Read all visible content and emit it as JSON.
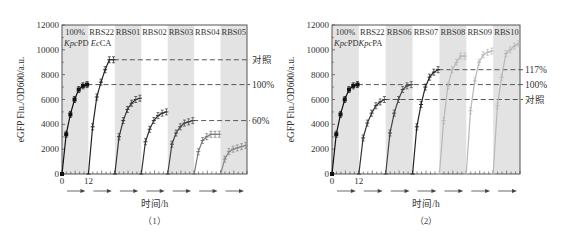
{
  "figure": {
    "panels": [
      {
        "id": "panel-1",
        "label": "（1）",
        "construct_label": {
          "italic1": "Kpc",
          "plain1": "PD ",
          "italic2": "Ec",
          "plain2": "CA"
        },
        "y_axis_label": "eGFP Flu./OD600/a.u.",
        "x_axis_label": "时间/h",
        "x_ticks": [
          "0",
          "12"
        ],
        "y_ticks": [
          "0",
          "2000",
          "4000",
          "6000",
          "8000",
          "10000",
          "12000"
        ],
        "segments": [
          "100%",
          "RBS22",
          "RBS01",
          "RBS02",
          "RBS03",
          "RBS04",
          "RBS05"
        ],
        "reference_lines": [
          {
            "label": "对照",
            "value": 9200
          },
          {
            "label": "100%",
            "value": 7200
          },
          {
            "label": "60%",
            "value": 4300
          }
        ]
      },
      {
        "id": "panel-2",
        "label": "（2）",
        "construct_label": {
          "italic1": "Kpc",
          "plain1": "PD",
          "italic2": "Kpc",
          "plain2": "PA"
        },
        "y_axis_label": "eGFP Flu./OD600/a.u.",
        "x_axis_label": "时间/h",
        "x_ticks": [
          "0",
          "12"
        ],
        "y_ticks": [
          "0",
          "2000",
          "4000",
          "6000",
          "8000",
          "10000",
          "12000"
        ],
        "segments": [
          "100%",
          "RBS22",
          "RBS06",
          "RBS07",
          "RBS08",
          "RBS09",
          "RBS10"
        ],
        "reference_lines": [
          {
            "label": "117%",
            "value": 8400
          },
          {
            "label": "100%",
            "value": 7200
          },
          {
            "label": "对照",
            "value": 6000
          }
        ]
      }
    ]
  },
  "chart_data": [
    {
      "type": "line",
      "title": "（1）",
      "xlabel": "时间/h",
      "ylabel": "eGFP Flu./OD600/a.u.",
      "ylim": [
        0,
        12000
      ],
      "x_hours_per_segment": 12,
      "x": [
        0,
        2,
        4,
        6,
        8,
        10,
        12
      ],
      "series": [
        {
          "name": "100%",
          "color": "#111111",
          "marker": "square",
          "values": [
            0,
            3200,
            4800,
            6000,
            6800,
            7100,
            7200
          ]
        },
        {
          "name": "RBS22",
          "color": "#222222",
          "marker": "cross",
          "values": [
            0,
            3800,
            6200,
            7400,
            8400,
            9200,
            9200
          ]
        },
        {
          "name": "RBS01",
          "color": "#333333",
          "marker": "cross",
          "values": [
            0,
            3000,
            4300,
            5200,
            5700,
            6000,
            6100
          ]
        },
        {
          "name": "RBS02",
          "color": "#333333",
          "marker": "cross",
          "values": [
            0,
            2600,
            3600,
            4300,
            4700,
            4900,
            5000
          ]
        },
        {
          "name": "RBS03",
          "color": "#444444",
          "marker": "cross",
          "values": [
            0,
            2400,
            3300,
            3800,
            4100,
            4200,
            4300
          ]
        },
        {
          "name": "RBS04",
          "color": "#777777",
          "marker": "cross",
          "values": [
            0,
            1800,
            2700,
            3000,
            3200,
            3200,
            3200
          ]
        },
        {
          "name": "RBS05",
          "color": "#888888",
          "marker": "cross",
          "values": [
            0,
            1200,
            1800,
            2000,
            2100,
            2200,
            2300
          ]
        }
      ],
      "reference_lines": [
        {
          "label": "对照",
          "value": 9200
        },
        {
          "label": "100%",
          "value": 7200
        },
        {
          "label": "60%",
          "value": 4300
        }
      ],
      "annotation": "KpcPD EcCA",
      "shaded_segments": [
        0,
        2,
        4,
        6
      ]
    },
    {
      "type": "line",
      "title": "（2）",
      "xlabel": "时间/h",
      "ylabel": "eGFP Flu./OD600/a.u.",
      "ylim": [
        0,
        12000
      ],
      "x_hours_per_segment": 12,
      "x": [
        0,
        2,
        4,
        6,
        8,
        10,
        12
      ],
      "series": [
        {
          "name": "100%",
          "color": "#111111",
          "marker": "square",
          "values": [
            0,
            3200,
            4800,
            6000,
            6800,
            7100,
            7200
          ]
        },
        {
          "name": "RBS22",
          "color": "#333333",
          "marker": "cross",
          "values": [
            0,
            2900,
            4100,
            4900,
            5500,
            5800,
            6000
          ]
        },
        {
          "name": "RBS06",
          "color": "#444444",
          "marker": "cross",
          "values": [
            0,
            3300,
            4900,
            6000,
            6800,
            7100,
            7200
          ]
        },
        {
          "name": "RBS07",
          "color": "#222222",
          "marker": "cross",
          "values": [
            0,
            3800,
            5600,
            7000,
            7800,
            8200,
            8400
          ]
        },
        {
          "name": "RBS08",
          "color": "#b8b8b8",
          "marker": "cross",
          "values": [
            0,
            4300,
            7100,
            8400,
            9000,
            9500,
            9500
          ]
        },
        {
          "name": "RBS09",
          "color": "#b8b8b8",
          "marker": "cross",
          "values": [
            0,
            5100,
            7500,
            9000,
            9600,
            9800,
            9900
          ]
        },
        {
          "name": "RBS10",
          "color": "#b8b8b8",
          "marker": "cross",
          "values": [
            0,
            5500,
            7800,
            9700,
            10000,
            10300,
            10500
          ]
        }
      ],
      "reference_lines": [
        {
          "label": "117%",
          "value": 8400
        },
        {
          "label": "100%",
          "value": 7200
        },
        {
          "label": "对照",
          "value": 6000
        }
      ],
      "annotation": "KpcPDKpcPA",
      "shaded_segments": [
        0,
        2,
        4,
        6
      ]
    }
  ]
}
